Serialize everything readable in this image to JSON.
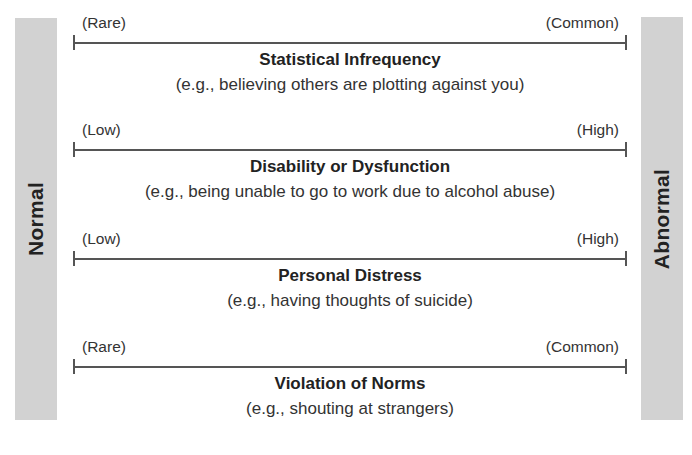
{
  "side_labels": {
    "left": "Normal",
    "right": "Abnormal"
  },
  "colors": {
    "side_bar": "#d2d2d2",
    "axis_line": "#555555",
    "text": "#222222"
  },
  "dimensions": [
    {
      "low_label": "(Rare)",
      "high_label": "(Common)",
      "title": "Statistical Infrequency",
      "example": "(e.g., believing others are plotting against you)"
    },
    {
      "low_label": "(Low)",
      "high_label": "(High)",
      "title": "Disability or Dysfunction",
      "example": "(e.g., being unable to go to work due to alcohol abuse)"
    },
    {
      "low_label": "(Low)",
      "high_label": "(High)",
      "title": "Personal Distress",
      "example": "(e.g., having thoughts of suicide)"
    },
    {
      "low_label": "(Rare)",
      "high_label": "(Common)",
      "title": "Violation of Norms",
      "example": "(e.g., shouting at strangers)"
    }
  ]
}
